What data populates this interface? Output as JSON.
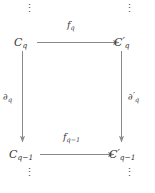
{
  "diagram": {
    "type": "commutative-square",
    "stroke_color": "#8a8a8a",
    "text_color": "#3a3a3a",
    "background_color": "#ffffff",
    "nodes": {
      "top_left": {
        "base": "C",
        "sub": "q",
        "prime": "",
        "label": "C_q"
      },
      "top_right": {
        "base": "C",
        "sub": "q",
        "prime": "′",
        "label": "C'_q"
      },
      "bottom_left": {
        "base": "C",
        "sub": "q−1",
        "prime": "",
        "label": "C_{q-1}"
      },
      "bottom_right": {
        "base": "C",
        "sub": "q−1",
        "prime": "′",
        "label": "C'_{q-1}"
      }
    },
    "arrows": {
      "top": {
        "base": "f",
        "sub": "q",
        "prime": "",
        "label": "f_q",
        "direction": "right"
      },
      "bottom": {
        "base": "f",
        "sub": "q−1",
        "prime": "",
        "label": "f_{q-1}",
        "direction": "right"
      },
      "left": {
        "base": "∂",
        "sub": "q",
        "prime": "",
        "label": "∂_q",
        "direction": "down"
      },
      "right": {
        "base": "∂",
        "sub": "q",
        "prime": "′",
        "label": "∂'_q",
        "direction": "down"
      }
    },
    "ellipses": {
      "glyph": "⋮",
      "top_left": "⋮",
      "top_right": "⋮",
      "bottom_left": "⋮",
      "bottom_right": "⋮"
    }
  }
}
